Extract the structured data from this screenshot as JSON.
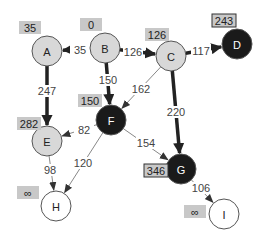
{
  "diagram": {
    "type": "weighted directed graph (shortest path / Dijkstra state)",
    "nodes": [
      {
        "id": "A",
        "x": 47,
        "y": 51,
        "state": "visited",
        "dist": "35",
        "dist_box": {
          "x": 19,
          "y": 21
        }
      },
      {
        "id": "B",
        "x": 105,
        "y": 48,
        "state": "visited",
        "dist": "0",
        "dist_box": {
          "x": 80,
          "y": 18
        }
      },
      {
        "id": "C",
        "x": 171,
        "y": 56,
        "state": "visited",
        "dist": "126",
        "dist_box": {
          "x": 145,
          "y": 28
        }
      },
      {
        "id": "D",
        "x": 237,
        "y": 44,
        "state": "frontier",
        "dist": "243",
        "dist_box": {
          "x": 212,
          "y": 14
        }
      },
      {
        "id": "E",
        "x": 47,
        "y": 141,
        "state": "visited",
        "dist": "282",
        "dist_box": {
          "x": 17,
          "y": 117
        }
      },
      {
        "id": "F",
        "x": 111,
        "y": 120,
        "state": "frontier",
        "dist": "150",
        "dist_box": {
          "x": 78,
          "y": 94
        }
      },
      {
        "id": "G",
        "x": 181,
        "y": 169,
        "state": "frontier",
        "dist": "346",
        "dist_box": {
          "x": 144,
          "y": 164
        }
      },
      {
        "id": "H",
        "x": 56,
        "y": 206,
        "state": "unvisited",
        "dist": "∞",
        "dist_box": {
          "x": 17,
          "y": 186
        }
      },
      {
        "id": "I",
        "x": 224,
        "y": 214,
        "state": "unvisited",
        "dist": "∞",
        "dist_box": {
          "x": 184,
          "y": 205
        }
      }
    ],
    "edges": [
      {
        "from": "B",
        "to": "A",
        "weight": "35",
        "bold": true,
        "label_pos": {
          "x": 80,
          "y": 50
        }
      },
      {
        "from": "B",
        "to": "C",
        "weight": "126",
        "bold": true,
        "label_pos": {
          "x": 133,
          "y": 52
        }
      },
      {
        "from": "C",
        "to": "D",
        "weight": "117",
        "bold": true,
        "label_pos": {
          "x": 201,
          "y": 51
        }
      },
      {
        "from": "B",
        "to": "F",
        "weight": "150",
        "bold": true,
        "label_pos": {
          "x": 108,
          "y": 80
        }
      },
      {
        "from": "C",
        "to": "F",
        "weight": "162",
        "bold": false,
        "label_pos": {
          "x": 141,
          "y": 89
        }
      },
      {
        "from": "A",
        "to": "E",
        "weight": "247",
        "bold": true,
        "label_pos": {
          "x": 47,
          "y": 91
        }
      },
      {
        "from": "C",
        "to": "G",
        "weight": "220",
        "bold": true,
        "label_pos": {
          "x": 176,
          "y": 112
        }
      },
      {
        "from": "F",
        "to": "E",
        "weight": "82",
        "bold": false,
        "label_pos": {
          "x": 84,
          "y": 130
        }
      },
      {
        "from": "F",
        "to": "G",
        "weight": "154",
        "bold": false,
        "label_pos": {
          "x": 146,
          "y": 143
        }
      },
      {
        "from": "E",
        "to": "H",
        "weight": "98",
        "bold": false,
        "label_pos": {
          "x": 50,
          "y": 170
        }
      },
      {
        "from": "F",
        "to": "H",
        "weight": "120",
        "bold": false,
        "label_pos": {
          "x": 83,
          "y": 163
        }
      },
      {
        "from": "G",
        "to": "I",
        "weight": "106",
        "bold": false,
        "label_pos": {
          "x": 201,
          "y": 188
        }
      }
    ]
  },
  "colors": {
    "visited_fill": "#d8d8d8",
    "frontier_fill": "#1a1a1a",
    "unvisited_fill": "#ffffff",
    "dist_box_fill": "#c8c8c8",
    "edge_dark": "#222222",
    "edge_light": "#888888"
  }
}
